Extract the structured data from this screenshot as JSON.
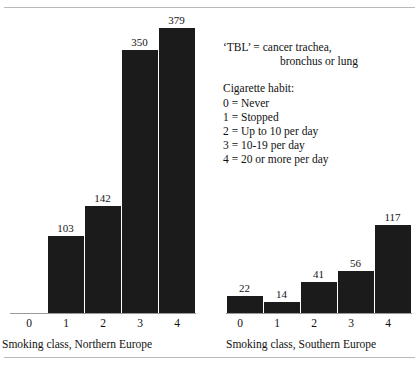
{
  "figure": {
    "cropped_header_text": "",
    "background_color": "#ffffff",
    "bar_color": "#1b1b1b",
    "axis_color": "#9a9a9a"
  },
  "legend": {
    "tbl_line1": "‘TBL’ = cancer trachea,",
    "tbl_line2": "bronchus or lung",
    "habit_title": "Cigarette habit:",
    "habit_items": [
      "0 = Never",
      "1 = Stopped",
      "2 = Up to 10 per day",
      "3 = 10-19 per day",
      "4 = 20 or more per day"
    ]
  },
  "chart_data": {
    "type": "bar",
    "title": "",
    "xlabel": "",
    "ylabel": "",
    "ylim": [
      0,
      379
    ],
    "grid": false,
    "legend_position": "inside-right",
    "panels": [
      {
        "name": "northern-europe",
        "axis_title": "Smoking class, Northern Europe",
        "categories": [
          "0",
          "1",
          "2",
          "3",
          "4"
        ],
        "values": [
          null,
          103,
          142,
          350,
          379
        ],
        "labels": [
          "",
          "103",
          "142",
          "350",
          "379"
        ]
      },
      {
        "name": "southern-europe",
        "axis_title": "Smoking class, Southern Europe",
        "categories": [
          "0",
          "1",
          "2",
          "3",
          "4"
        ],
        "values": [
          22,
          14,
          41,
          56,
          117
        ],
        "labels": [
          "22",
          "14",
          "41",
          "56",
          "117"
        ]
      }
    ]
  }
}
